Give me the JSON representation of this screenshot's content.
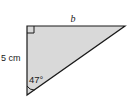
{
  "diagram": {
    "type": "right-triangle",
    "fill_color": "#d9d9d9",
    "stroke_color": "#1a1a1a",
    "labels": {
      "top_side": "b",
      "left_side": "5 cm",
      "angle": "47°"
    },
    "markers": {
      "right_angle": "top-left vertex",
      "angle_arc": "bottom vertex"
    }
  }
}
